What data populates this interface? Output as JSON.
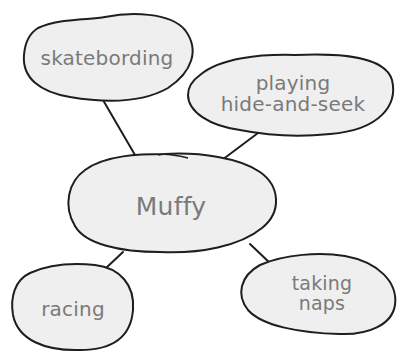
{
  "diagram": {
    "type": "concept-map",
    "center": {
      "label": "Muffy"
    },
    "nodes": [
      {
        "id": "skateboarding",
        "label": "skatebording"
      },
      {
        "id": "hide-and-seek",
        "line1": "playing",
        "line2": "hide-and-seek"
      },
      {
        "id": "racing",
        "label": "racing"
      },
      {
        "id": "taking-naps",
        "line1": "taking",
        "line2": "naps"
      }
    ],
    "colors": {
      "bubble_fill": "#efefef",
      "outline": "#1e1e1e",
      "text": "#7a7a7a",
      "background": "#ffffff"
    }
  }
}
